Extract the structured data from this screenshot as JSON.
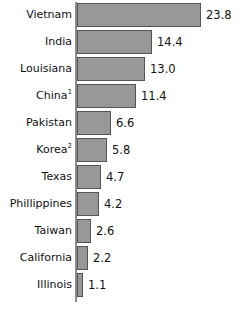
{
  "chart_data": {
    "type": "bar",
    "orientation": "horizontal",
    "title": "",
    "subtitle": "",
    "xlabel": "",
    "ylabel": "",
    "grid": false,
    "legend": false,
    "axis": {
      "category_axis": "vertical-left",
      "value_axis_visible": false,
      "tick_labels_visible": false,
      "xlim": [
        0,
        23.8
      ]
    },
    "data_labels": true,
    "categories": [
      "Vietnam",
      "India",
      "Louisiana",
      "China",
      "Pakistan",
      "Korea",
      "Texas",
      "Phillippines",
      "Taiwan",
      "California",
      "Illinois"
    ],
    "values": [
      23.8,
      14.4,
      13.0,
      11.4,
      6.6,
      5.8,
      4.7,
      4.2,
      2.6,
      2.2,
      1.1
    ],
    "footnote_markers": [
      "",
      "",
      "",
      "1",
      "",
      "2",
      "",
      "",
      "",
      "",
      ""
    ],
    "value_labels": [
      "23.8",
      "14.4",
      "13.0",
      "11.4",
      "6.6",
      "5.8",
      "4.7",
      "4.2",
      "2.6",
      "2.2",
      "1.1"
    ],
    "colors": {
      "bar_fill": "#989898",
      "bar_stroke": "#555555",
      "axis_line": "#8a8a8a",
      "text": "#111111",
      "background": "#ffffff"
    }
  },
  "rows": [
    {
      "label": "Vietnam",
      "sup": "",
      "value": 23.8,
      "value_label": "23.8"
    },
    {
      "label": "India",
      "sup": "",
      "value": 14.4,
      "value_label": "14.4"
    },
    {
      "label": "Louisiana",
      "sup": "",
      "value": 13.0,
      "value_label": "13.0"
    },
    {
      "label": "China",
      "sup": "1",
      "value": 11.4,
      "value_label": "11.4"
    },
    {
      "label": "Pakistan",
      "sup": "",
      "value": 6.6,
      "value_label": "6.6"
    },
    {
      "label": "Korea",
      "sup": "2",
      "value": 5.8,
      "value_label": "5.8"
    },
    {
      "label": "Texas",
      "sup": "",
      "value": 4.7,
      "value_label": "4.7"
    },
    {
      "label": "Phillippines",
      "sup": "",
      "value": 4.2,
      "value_label": "4.2"
    },
    {
      "label": "Taiwan",
      "sup": "",
      "value": 2.6,
      "value_label": "2.6"
    },
    {
      "label": "California",
      "sup": "",
      "value": 2.2,
      "value_label": "2.2"
    },
    {
      "label": "Illinois",
      "sup": "",
      "value": 1.1,
      "value_label": "1.1"
    }
  ]
}
